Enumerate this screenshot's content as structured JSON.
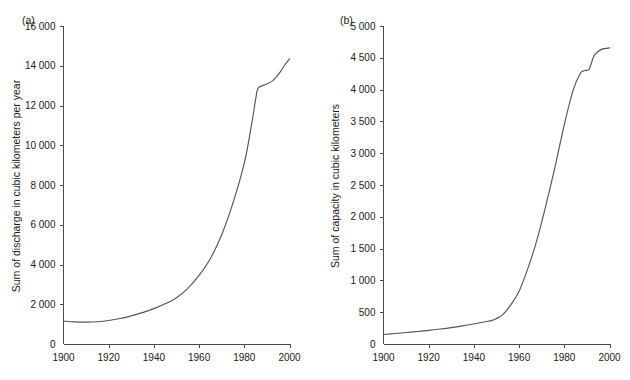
{
  "figure": {
    "background": "#ffffff",
    "line_color": "#555555",
    "axis_color": "#4a4a4a"
  },
  "chart_data": [
    {
      "type": "line",
      "panel_label": "(a)",
      "title": "",
      "xlabel": "",
      "ylabel": "Sum of discharge in cubic kilometers per year",
      "xlim": [
        1900,
        2000
      ],
      "ylim": [
        0,
        16000
      ],
      "grid": false,
      "legend": "none",
      "xticks": [
        1900,
        1920,
        1940,
        1960,
        1980,
        2000
      ],
      "xtick_labels": [
        "1900",
        "1920",
        "1940",
        "1960",
        "1980",
        "2000"
      ],
      "yticks": [
        0,
        2000,
        4000,
        6000,
        8000,
        10000,
        12000,
        14000,
        16000
      ],
      "ytick_labels": [
        "0",
        "2 000",
        "4 000",
        "6 000",
        "8 000",
        "10 000",
        "12 000",
        "14 000",
        "16 000"
      ],
      "series": [
        {
          "name": "Sum of discharge",
          "color": "#555555",
          "x": [
            1900,
            1905,
            1910,
            1915,
            1920,
            1925,
            1930,
            1935,
            1940,
            1945,
            1950,
            1955,
            1960,
            1965,
            1970,
            1975,
            1980,
            1983,
            1985,
            1986,
            1988,
            1990,
            1992,
            1994,
            1996,
            1998,
            2000
          ],
          "values": [
            1150,
            1110,
            1100,
            1120,
            1180,
            1280,
            1420,
            1580,
            1780,
            2020,
            2330,
            2800,
            3450,
            4300,
            5500,
            7100,
            9100,
            10900,
            12300,
            12850,
            13000,
            13080,
            13200,
            13420,
            13700,
            14050,
            14350
          ]
        }
      ]
    },
    {
      "type": "line",
      "panel_label": "(b)",
      "title": "",
      "xlabel": "",
      "ylabel": "Sum of capacity in cubic kilometers",
      "xlim": [
        1900,
        2000
      ],
      "ylim": [
        0,
        5000
      ],
      "grid": false,
      "legend": "none",
      "xticks": [
        1900,
        1920,
        1940,
        1960,
        1980,
        2000
      ],
      "xtick_labels": [
        "1900",
        "1920",
        "1940",
        "1960",
        "1980",
        "2000"
      ],
      "yticks": [
        0,
        500,
        1000,
        1500,
        2000,
        2500,
        3000,
        3500,
        4000,
        4500,
        5000
      ],
      "ytick_labels": [
        "0",
        "500",
        "1 000",
        "1 500",
        "2 000",
        "2 500",
        "3 000",
        "3 500",
        "4 000",
        "4 500",
        "5 000"
      ],
      "series": [
        {
          "name": "Sum of capacity",
          "color": "#555555",
          "x": [
            1900,
            1905,
            1910,
            1915,
            1920,
            1925,
            1930,
            1935,
            1940,
            1945,
            1948,
            1950,
            1953,
            1956,
            1960,
            1964,
            1968,
            1972,
            1976,
            1980,
            1984,
            1987,
            1989,
            1991,
            1993,
            1995,
            1997,
            2000
          ],
          "values": [
            150,
            165,
            180,
            196,
            214,
            235,
            258,
            285,
            315,
            350,
            372,
            400,
            470,
            600,
            830,
            1200,
            1650,
            2200,
            2800,
            3450,
            4000,
            4250,
            4300,
            4320,
            4520,
            4600,
            4640,
            4655
          ]
        }
      ]
    }
  ]
}
